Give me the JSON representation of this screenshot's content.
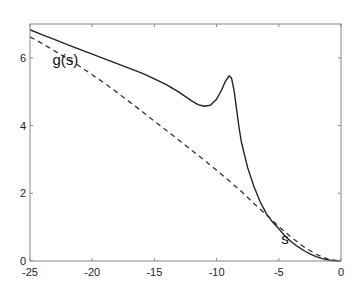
{
  "chart_data": {
    "type": "line",
    "title": "",
    "xlabel": "",
    "ylabel": "",
    "xlim": [
      -25,
      0
    ],
    "ylim": [
      0,
      7
    ],
    "grid": false,
    "legend": null,
    "x_ticks": [
      -25,
      -20,
      -15,
      -10,
      -5,
      0
    ],
    "y_ticks": [
      0,
      2,
      4,
      6
    ],
    "annotations": [
      {
        "text": "g(s)",
        "x": -23.2,
        "y": 5.8
      },
      {
        "text": "s",
        "x": -4.8,
        "y": 0.5
      }
    ],
    "series": [
      {
        "name": "solid",
        "style": "solid",
        "x": [
          -25,
          -24,
          -23,
          -22,
          -21,
          -20,
          -19,
          -18,
          -17,
          -16,
          -15,
          -14,
          -13,
          -12,
          -11.5,
          -11,
          -10.5,
          -10,
          -9.6,
          -9.3,
          -9.0,
          -8.8,
          -8.6,
          -8.4,
          -8.2,
          -8.0,
          -7.5,
          -7,
          -6.5,
          -6,
          -5.5,
          -5,
          -4.5,
          -4,
          -3.5,
          -3,
          -2.5,
          -2,
          -1.5,
          -1,
          -0.5,
          0
        ],
        "y": [
          6.83,
          6.68,
          6.54,
          6.39,
          6.25,
          6.11,
          5.97,
          5.83,
          5.69,
          5.55,
          5.38,
          5.2,
          4.98,
          4.73,
          4.62,
          4.57,
          4.6,
          4.78,
          5.05,
          5.3,
          5.47,
          5.4,
          5.05,
          4.5,
          3.95,
          3.5,
          2.75,
          2.2,
          1.75,
          1.4,
          1.15,
          0.95,
          0.74,
          0.57,
          0.43,
          0.31,
          0.21,
          0.13,
          0.07,
          0.03,
          0.008,
          0
        ]
      },
      {
        "name": "dashed",
        "style": "dashed",
        "x": [
          -25,
          -24,
          -23,
          -22,
          -21,
          -20,
          -19,
          -18,
          -17,
          -16,
          -15,
          -14,
          -13,
          -12,
          -11,
          -10,
          -9,
          -8,
          -7,
          -6,
          -5,
          -4,
          -3,
          -2,
          -1,
          0
        ],
        "y": [
          6.62,
          6.42,
          6.2,
          5.98,
          5.75,
          5.5,
          5.25,
          4.98,
          4.7,
          4.42,
          4.13,
          3.85,
          3.56,
          3.27,
          2.98,
          2.68,
          2.37,
          2.05,
          1.7,
          1.36,
          1.02,
          0.7,
          0.42,
          0.2,
          0.05,
          0
        ]
      }
    ]
  },
  "plot": {
    "colors": {
      "axis": "#888888",
      "solid_line": "#222222",
      "dashed_line": "#333333",
      "background": "#ffffff"
    }
  }
}
